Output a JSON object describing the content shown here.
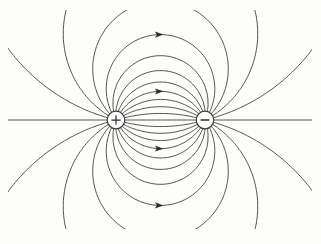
{
  "figure": {
    "figure_type": "electric-dipole-field-lines",
    "background_color": "#fdfdfc",
    "line_color": "#4a4a4a",
    "line_width": 0.95,
    "bounds": {
      "x0": 8,
      "y0": 10,
      "x1": 312,
      "y1": 229
    },
    "charges": [
      {
        "sign": "+",
        "x": 116,
        "y": 120,
        "radius": 8.8,
        "charge": 1
      },
      {
        "sign": "-",
        "x": 205,
        "y": 120,
        "radius": 8.8,
        "charge": -1
      }
    ],
    "charge_style": {
      "fill": "#fdfdfc",
      "stroke": "#3c3c3c",
      "stroke_width": 1.2,
      "symbol_color": "#2d2d2d",
      "plus_half_len": 4.2,
      "plus_stroke_width": 1.25,
      "minus_half_len": 3.8,
      "minus_stroke_width": 1.6
    },
    "lines_per_charge": 24,
    "angle_step_deg": 15,
    "arrows": {
      "color": "#2d2d2d",
      "cross_x": 158.5,
      "launch_angles_deg": [
        60,
        120,
        240,
        300
      ],
      "shape": "M 5 0 L -3.6 3.1 L -1.6 0 L -3.6 -3.1 Z"
    }
  }
}
